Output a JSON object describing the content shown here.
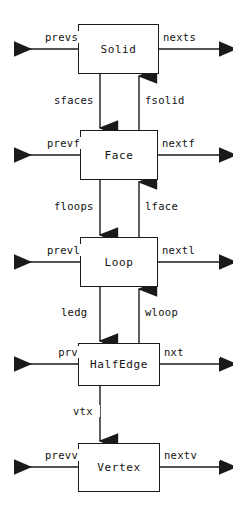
{
  "diagram": {
    "type": "node-link-diagram",
    "stroke_color": "#1a1a1a",
    "background_color": "#ffffff",
    "nodes": [
      {
        "id": "solid",
        "label": "Solid",
        "x": 78,
        "y": 24,
        "w": 81,
        "h": 50
      },
      {
        "id": "face",
        "label": "Face",
        "x": 80,
        "y": 130,
        "w": 78,
        "h": 50
      },
      {
        "id": "loop",
        "label": "Loop",
        "x": 80,
        "y": 237,
        "w": 78,
        "h": 50
      },
      {
        "id": "halfedge",
        "label": "HalfEdge",
        "x": 78,
        "y": 343,
        "w": 82,
        "h": 43
      },
      {
        "id": "vertex",
        "label": "Vertex",
        "x": 78,
        "y": 443,
        "w": 82,
        "h": 49
      }
    ],
    "side_links": [
      {
        "node": "solid",
        "left_label": "prevs",
        "right_label": "nexts",
        "y": 49
      },
      {
        "node": "face",
        "left_label": "prevf",
        "right_label": "nextf",
        "y": 155
      },
      {
        "node": "loop",
        "left_label": "prevl",
        "right_label": "nextl",
        "y": 262
      },
      {
        "node": "halfedge",
        "left_label": "prv",
        "right_label": "nxt",
        "y": 364
      },
      {
        "node": "vertex",
        "left_label": "prevv",
        "right_label": "nextv",
        "y": 467
      }
    ],
    "vertical_links": [
      {
        "label": "sfaces",
        "from": "solid",
        "to": "face",
        "direction": "down",
        "x": 100
      },
      {
        "label": "fsolid",
        "from": "face",
        "to": "solid",
        "direction": "up",
        "x": 139
      },
      {
        "label": "floops",
        "from": "face",
        "to": "loop",
        "direction": "down",
        "x": 100
      },
      {
        "label": "lface",
        "from": "loop",
        "to": "face",
        "direction": "up",
        "x": 139
      },
      {
        "label": "ledg",
        "from": "loop",
        "to": "halfedge",
        "direction": "down",
        "x": 100
      },
      {
        "label": "wloop",
        "from": "halfedge",
        "to": "loop",
        "direction": "up",
        "x": 139
      },
      {
        "label": "vtx",
        "from": "halfedge",
        "to": "vertex",
        "direction": "down",
        "x": 100
      }
    ]
  }
}
